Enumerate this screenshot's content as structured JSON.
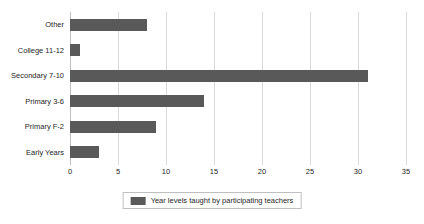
{
  "chart_data": {
    "type": "bar",
    "orientation": "horizontal",
    "title": "",
    "xlabel": "",
    "ylabel": "",
    "categories": [
      "Other",
      "College 11-12",
      "Secondary 7-10",
      "Primary 3-6",
      "Primary F-2",
      "Early Years"
    ],
    "values": [
      8,
      1,
      31,
      14,
      9,
      3
    ],
    "series": [
      {
        "name": "Year levels taught by participating teachers",
        "values": [
          8,
          1,
          31,
          14,
          9,
          3
        ],
        "color": "#595959"
      }
    ],
    "xlim": [
      0,
      35
    ],
    "xticks": [
      0,
      5,
      10,
      15,
      20,
      25,
      30,
      35
    ],
    "xtick_labels": [
      "0",
      "5",
      "10",
      "15",
      "20",
      "25",
      "30",
      "35"
    ],
    "grid": "vertical",
    "legend_position": "bottom-center"
  },
  "legend": {
    "label": "Year levels taught by participating teachers",
    "swatch_color": "#595959"
  },
  "colors": {
    "bar": "#595959",
    "gridline": "#d9d9d9",
    "axis": "#bfbfbf",
    "text": "#262626",
    "background": "#ffffff"
  }
}
